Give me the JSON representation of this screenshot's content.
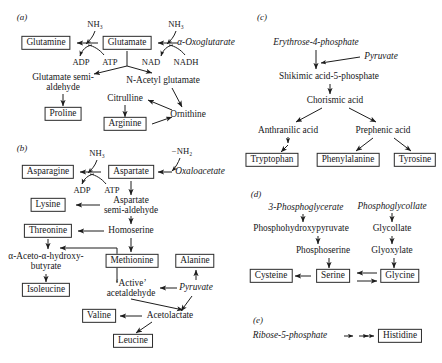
{
  "figure": {
    "type": "biochemical-pathway-diagram",
    "panels": [
      {
        "id": "a",
        "label": "(a)",
        "name": "glutamate-family",
        "nodes": [
          {
            "id": "glutamine",
            "text": "Glutamine",
            "style": "boxed",
            "x": 46,
            "y": 43
          },
          {
            "id": "glutamate",
            "text": "Glutamate",
            "style": "boxed",
            "x": 127,
            "y": 43
          },
          {
            "id": "oxoglutarate",
            "text": "α-Oxoglutarate",
            "style": "italic",
            "x": 206,
            "y": 43
          },
          {
            "id": "nh3_left",
            "text": "NH₃",
            "style": "plain",
            "x": 95,
            "y": 24
          },
          {
            "id": "nh3_right",
            "text": "NH₃",
            "style": "plain",
            "x": 176,
            "y": 24
          },
          {
            "id": "adp",
            "text": "ADP",
            "style": "plain",
            "x": 81,
            "y": 62
          },
          {
            "id": "atp",
            "text": "ATP",
            "style": "plain",
            "x": 110,
            "y": 62
          },
          {
            "id": "nad",
            "text": "NAD",
            "style": "plain",
            "x": 151,
            "y": 62
          },
          {
            "id": "nadh",
            "text": "NADH",
            "style": "plain",
            "x": 186,
            "y": 62
          },
          {
            "id": "glutamate_semialdehyde",
            "text": "Glutamate semi-\naldehyde",
            "style": "multi",
            "x": 63,
            "y": 83
          },
          {
            "id": "n_acetyl_glutamate",
            "text": "N-Acetyl glutamate",
            "style": "plain",
            "x": 163,
            "y": 81
          },
          {
            "id": "proline",
            "text": "Proline",
            "style": "boxed",
            "x": 63,
            "y": 114
          },
          {
            "id": "citrulline",
            "text": "Citrulline",
            "style": "plain",
            "x": 125,
            "y": 99
          },
          {
            "id": "ornithine",
            "text": "Ornithine",
            "style": "plain",
            "x": 188,
            "y": 115
          },
          {
            "id": "arginine",
            "text": "Arginine",
            "style": "boxed",
            "x": 125,
            "y": 124
          }
        ]
      },
      {
        "id": "b",
        "label": "(b)",
        "name": "aspartate-and-pyruvate-family",
        "nodes": [
          {
            "id": "asparagine",
            "text": "Asparagine",
            "style": "boxed",
            "x": 48,
            "y": 172
          },
          {
            "id": "aspartate",
            "text": "Aspartate",
            "style": "boxed",
            "x": 131,
            "y": 172
          },
          {
            "id": "oxaloacetate",
            "text": "Oxaloacetate",
            "style": "italic",
            "x": 200,
            "y": 172
          },
          {
            "id": "nh3_b",
            "text": "NH₃",
            "style": "plain",
            "x": 97,
            "y": 153
          },
          {
            "id": "minus_nh2",
            "text": "−NH₂",
            "style": "plain",
            "x": 182,
            "y": 151
          },
          {
            "id": "adp_b",
            "text": "ADP",
            "style": "plain",
            "x": 82,
            "y": 190
          },
          {
            "id": "atp_b",
            "text": "ATP",
            "style": "plain",
            "x": 112,
            "y": 190
          },
          {
            "id": "aspartate_semialdehyde",
            "text": "Aspartate\nsemi-aldehyde",
            "style": "multi",
            "x": 131,
            "y": 206
          },
          {
            "id": "lysine",
            "text": "Lysine",
            "style": "boxed",
            "x": 48,
            "y": 205
          },
          {
            "id": "homoserine",
            "text": "Homoserine",
            "style": "plain",
            "x": 131,
            "y": 231
          },
          {
            "id": "threonine",
            "text": "Threonine",
            "style": "boxed",
            "x": 48,
            "y": 231
          },
          {
            "id": "aceto_hydroxybutyrate",
            "text": "α-Aceto-α-hydroxy-\nbutyrate",
            "style": "multi",
            "x": 46,
            "y": 262
          },
          {
            "id": "isoleucine",
            "text": "Isoleucine",
            "style": "boxed",
            "x": 46,
            "y": 290
          },
          {
            "id": "methionine",
            "text": "Methionine",
            "style": "boxed",
            "x": 132,
            "y": 261
          },
          {
            "id": "active_acetaldehyde",
            "text": "‘Active’\nacetaldehyde",
            "style": "multi",
            "x": 131,
            "y": 289
          },
          {
            "id": "alanine",
            "text": "Alanine",
            "style": "boxed",
            "x": 195,
            "y": 261
          },
          {
            "id": "pyruvate",
            "text": "Pyruvate",
            "style": "italic",
            "x": 196,
            "y": 288
          },
          {
            "id": "acetolactate",
            "text": "Acetolactate",
            "style": "plain",
            "x": 170,
            "y": 316
          },
          {
            "id": "valine",
            "text": "Valine",
            "style": "boxed",
            "x": 99,
            "y": 316
          },
          {
            "id": "leucine",
            "text": "Leucine",
            "style": "boxed",
            "x": 133,
            "y": 341
          }
        ]
      },
      {
        "id": "c",
        "label": "(c)",
        "name": "aromatic-amino-acid-family",
        "nodes": [
          {
            "id": "erythrose4p",
            "text": "Erythrose-4-phosphate",
            "style": "italic",
            "x": 316,
            "y": 43
          },
          {
            "id": "pyruvate_c",
            "text": "Pyruvate",
            "style": "italic",
            "x": 381,
            "y": 57
          },
          {
            "id": "shikimic",
            "text": "Shikimic acid-5-phosphate",
            "style": "plain",
            "x": 329,
            "y": 77
          },
          {
            "id": "chorismic",
            "text": "Chorismic acid",
            "style": "plain",
            "x": 335,
            "y": 101
          },
          {
            "id": "anthranilic",
            "text": "Anthranilic acid",
            "style": "plain",
            "x": 288,
            "y": 131
          },
          {
            "id": "prephenic",
            "text": "Prephenic acid",
            "style": "plain",
            "x": 383,
            "y": 131
          },
          {
            "id": "tryptophan",
            "text": "Tryptophan",
            "style": "boxed",
            "x": 272,
            "y": 160
          },
          {
            "id": "phenylalanine",
            "text": "Phenylalanine",
            "style": "boxed",
            "x": 348,
            "y": 160
          },
          {
            "id": "tyrosine",
            "text": "Tyrosine",
            "style": "boxed",
            "x": 415,
            "y": 160
          }
        ]
      },
      {
        "id": "d",
        "label": "(d)",
        "name": "serine-glycine-family",
        "nodes": [
          {
            "id": "pg3",
            "text": "3-Phosphoglycerate",
            "style": "italic",
            "x": 306,
            "y": 208
          },
          {
            "id": "phosphoglycollate",
            "text": "Phosphoglycollate",
            "style": "italic",
            "x": 392,
            "y": 207
          },
          {
            "id": "phosphohydroxypyruvate",
            "text": "Phosphohydroxypyruvate",
            "style": "plain",
            "x": 301,
            "y": 229
          },
          {
            "id": "glycollate",
            "text": "Glycollate",
            "style": "plain",
            "x": 392,
            "y": 229
          },
          {
            "id": "phosphoserine",
            "text": "Phosphoserine",
            "style": "plain",
            "x": 323,
            "y": 251
          },
          {
            "id": "glyoxylate",
            "text": "Glyoxylate",
            "style": "plain",
            "x": 392,
            "y": 251
          },
          {
            "id": "cysteine",
            "text": "Cysteine",
            "style": "boxed",
            "x": 271,
            "y": 276
          },
          {
            "id": "serine",
            "text": "Serine",
            "style": "boxed",
            "x": 333,
            "y": 276
          },
          {
            "id": "glycine",
            "text": "Glycine",
            "style": "boxed",
            "x": 400,
            "y": 276
          }
        ]
      },
      {
        "id": "e",
        "label": "(e)",
        "name": "histidine-family",
        "nodes": [
          {
            "id": "ribose5p",
            "text": "Ribose-5-phosphate",
            "style": "italic",
            "x": 290,
            "y": 336
          },
          {
            "id": "histidine",
            "text": "Histidine",
            "style": "boxed",
            "x": 400,
            "y": 336
          }
        ]
      }
    ],
    "panel_labels": [
      {
        "id": "a",
        "text": "(a)",
        "x": 22,
        "y": 17
      },
      {
        "id": "b",
        "text": "(b)",
        "x": 22,
        "y": 148
      },
      {
        "id": "c",
        "text": "(c)",
        "x": 262,
        "y": 17
      },
      {
        "id": "d",
        "text": "(d)",
        "x": 256,
        "y": 194
      },
      {
        "id": "e",
        "text": "(e)",
        "x": 258,
        "y": 320
      }
    ],
    "colors": {
      "ink": "#17171a",
      "box_border": "#2b2b2b",
      "background": "#ffffff"
    }
  }
}
